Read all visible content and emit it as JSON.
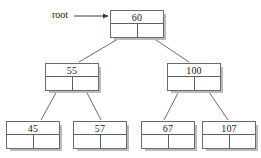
{
  "diagram": {
    "root_label": "root",
    "colors": {
      "background": "#ffffff",
      "stroke": "#666b6e",
      "shadow": "#b9bbbd",
      "text": "#1a1a1a"
    }
  },
  "nodes": [
    {
      "id": "n60",
      "key": "60",
      "x": 110,
      "y": 10,
      "w": 54,
      "level": 0
    },
    {
      "id": "n55",
      "key": "55",
      "x": 45,
      "y": 63,
      "w": 54,
      "level": 1
    },
    {
      "id": "n100",
      "key": "100",
      "x": 167,
      "y": 63,
      "w": 54,
      "level": 1
    },
    {
      "id": "n45",
      "key": "45",
      "x": 6,
      "y": 121,
      "w": 54,
      "level": 2
    },
    {
      "id": "n57",
      "key": "57",
      "x": 73,
      "y": 121,
      "w": 54,
      "level": 2
    },
    {
      "id": "n67",
      "key": "67",
      "x": 141,
      "y": 121,
      "w": 54,
      "level": 2
    },
    {
      "id": "n107",
      "key": "107",
      "x": 202,
      "y": 121,
      "w": 54,
      "level": 2
    }
  ],
  "edges": [
    {
      "from": "n60",
      "to": "n55",
      "x1": 123,
      "y1": 36,
      "x2": 79,
      "y2": 62
    },
    {
      "from": "n60",
      "to": "n100",
      "x1": 150,
      "y1": 36,
      "x2": 189,
      "y2": 62
    },
    {
      "from": "n55",
      "to": "n45",
      "x1": 58,
      "y1": 89,
      "x2": 41,
      "y2": 120
    },
    {
      "from": "n55",
      "to": "n57",
      "x1": 85,
      "y1": 89,
      "x2": 101,
      "y2": 120
    },
    {
      "from": "n100",
      "to": "n67",
      "x1": 180,
      "y1": 89,
      "x2": 164,
      "y2": 120
    },
    {
      "from": "n100",
      "to": "n107",
      "x1": 207,
      "y1": 89,
      "x2": 228,
      "y2": 120
    }
  ],
  "root_pointer": {
    "label": "root",
    "label_x": 52,
    "label_y": 9,
    "line_x1": 74,
    "line_y1": 16,
    "line_x2": 108,
    "line_y2": 16
  }
}
